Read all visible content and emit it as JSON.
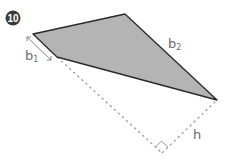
{
  "badge": {
    "number": "10",
    "bg_color": "#3a3a3a"
  },
  "figure": {
    "shape": "trapezoid",
    "fill_color": "#b4b4b4",
    "stroke_color": "#2a2a2a",
    "vertices": {
      "left": [
        33,
        34
      ],
      "top": [
        125,
        14
      ],
      "right": [
        217,
        100
      ],
      "lower_left": [
        57,
        57
      ]
    },
    "height_foot": [
      162,
      153
    ]
  },
  "labels": {
    "b1": {
      "base": "b",
      "sub": "1"
    },
    "b2": {
      "base": "b",
      "sub": "2"
    },
    "h": "h"
  },
  "dashed_color": "#999999"
}
